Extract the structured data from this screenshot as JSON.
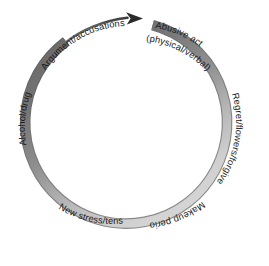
{
  "diagram": {
    "type": "cycle",
    "direction": "clockwise",
    "ring": {
      "center_x": 134,
      "center_y": 124,
      "radius": 101,
      "stroke_width": 9,
      "color_dark": "#6f6f6f",
      "color_light": "#cfcfcf",
      "outline_color": "#6b6b6b"
    },
    "arrow": {
      "name": "clockwise-arrow-head",
      "color": "#2b2b2b"
    },
    "stages": [
      {
        "id": "abusive-act",
        "label": "Abusive act",
        "sublabel": "(physical/verbal)",
        "position": "top"
      },
      {
        "id": "regret-flowers-forgiveness",
        "label": "Regret/flowers/forgiveness",
        "sublabel": "",
        "position": "right"
      },
      {
        "id": "makeup-period",
        "label": "Makeup period",
        "sublabel": "",
        "position": "bottom-right"
      },
      {
        "id": "new-stress-tension",
        "label": "New stress/tension",
        "sublabel": "",
        "position": "bottom-left"
      },
      {
        "id": "alcohol-drugs",
        "label": "Alcohol/drugs",
        "sublabel": "",
        "position": "left"
      },
      {
        "id": "argument-accusations",
        "label": "Argument/accusations",
        "sublabel": "",
        "position": "top-left"
      }
    ]
  }
}
